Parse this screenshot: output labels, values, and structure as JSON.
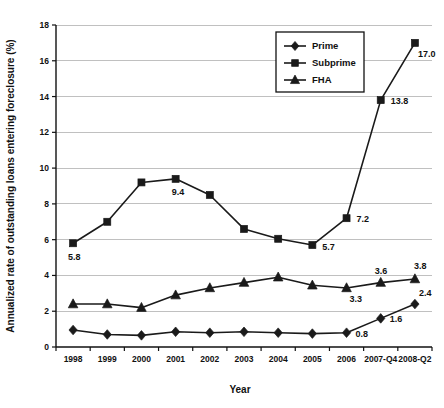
{
  "chart_data": {
    "type": "line",
    "title": "",
    "subtitle": "",
    "xlabel": "Year",
    "ylabel": "Annualized rate of outstanding loans entering foreclosure (%)",
    "categories": [
      "1998",
      "1999",
      "2000",
      "2001",
      "2002",
      "2003",
      "2004",
      "2005",
      "2006",
      "2007-Q4",
      "2008-Q2"
    ],
    "ylim": [
      0,
      18
    ],
    "ytick_values": [
      0,
      2,
      4,
      6,
      8,
      10,
      12,
      14,
      16,
      18
    ],
    "ytick_labels": [
      "0",
      "2",
      "4",
      "6",
      "8",
      "10",
      "12",
      "14",
      "16",
      "18"
    ],
    "grid": true,
    "grid_axis": "y",
    "legend_position": "top-right",
    "series": [
      {
        "name": "Prime",
        "marker": "diamond",
        "values": [
          0.95,
          0.7,
          0.65,
          0.85,
          0.8,
          0.85,
          0.8,
          0.75,
          0.8,
          1.6,
          2.4
        ],
        "labels": [
          {
            "category": "2006",
            "value": 0.8,
            "text": "0.8"
          },
          {
            "category": "2007-Q4",
            "value": 1.6,
            "text": "1.6"
          },
          {
            "category": "2008-Q2",
            "value": 2.4,
            "text": "2.4"
          }
        ]
      },
      {
        "name": "Subprime",
        "marker": "square",
        "values": [
          5.8,
          7.0,
          9.2,
          9.4,
          8.5,
          6.6,
          6.05,
          5.7,
          7.2,
          13.8,
          17.0
        ],
        "labels": [
          {
            "category": "1998",
            "value": 5.8,
            "text": "5.8"
          },
          {
            "category": "2001",
            "value": 9.4,
            "text": "9.4"
          },
          {
            "category": "2005",
            "value": 5.7,
            "text": "5.7"
          },
          {
            "category": "2006",
            "value": 7.2,
            "text": "7.2"
          },
          {
            "category": "2007-Q4",
            "value": 13.8,
            "text": "13.8"
          },
          {
            "category": "2008-Q2",
            "value": 17.0,
            "text": "17.0"
          }
        ]
      },
      {
        "name": "FHA",
        "marker": "triangle",
        "values": [
          2.4,
          2.4,
          2.2,
          2.9,
          3.3,
          3.6,
          3.9,
          3.45,
          3.3,
          3.6,
          3.8
        ],
        "labels": [
          {
            "category": "2006",
            "value": 3.3,
            "text": "3.3"
          },
          {
            "category": "2007-Q4",
            "value": 3.6,
            "text": "3.6"
          },
          {
            "category": "2008-Q2",
            "value": 3.8,
            "text": "3.8"
          }
        ]
      }
    ],
    "colors": {
      "series_stroke": "#1a1a1a",
      "marker_fill": "#1a1a1a",
      "gridline": "#b9b9b9",
      "axis": "#111111",
      "background": "#ffffff"
    }
  },
  "legend": {
    "entries": [
      {
        "label": "Prime",
        "marker": "diamond"
      },
      {
        "label": "Subprime",
        "marker": "square"
      },
      {
        "label": "FHA",
        "marker": "triangle"
      }
    ]
  },
  "labels_offsets": {
    "note": ""
  }
}
